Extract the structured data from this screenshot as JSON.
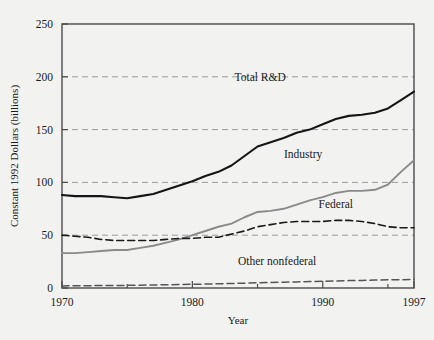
{
  "chart_data": {
    "type": "line",
    "title": "",
    "xlabel": "Year",
    "ylabel": "Constant 1992 Dollars (billions)",
    "xlim": [
      1970,
      1997
    ],
    "ylim": [
      0,
      250
    ],
    "xticks": [
      1970,
      1980,
      1990,
      1997
    ],
    "xtick_labels": [
      "1970",
      "1980",
      "1990",
      "1997"
    ],
    "minor_xticks": [
      1975,
      1985,
      1995
    ],
    "yticks": [
      0,
      50,
      100,
      150,
      200,
      250
    ],
    "ytick_labels": [
      "0",
      "50",
      "100",
      "150",
      "200",
      "250"
    ],
    "grid": "horizontal-dashed",
    "legend_position": "inline-annotations",
    "x": [
      1970,
      1971,
      1972,
      1973,
      1974,
      1975,
      1976,
      1977,
      1978,
      1979,
      1980,
      1981,
      1982,
      1983,
      1984,
      1985,
      1986,
      1987,
      1988,
      1989,
      1990,
      1991,
      1992,
      1993,
      1994,
      1995,
      1996,
      1997
    ],
    "series": [
      {
        "name": "Total R&D",
        "style": "solid",
        "color": "#151515",
        "width": 2.1,
        "label_x": 1985.2,
        "label_y": 196,
        "values": [
          88,
          87,
          87,
          87,
          86,
          85,
          87,
          89,
          93,
          97,
          101,
          106,
          110,
          116,
          125,
          134,
          138,
          142,
          147,
          150,
          155,
          160,
          163,
          164,
          166,
          170,
          178,
          186
        ]
      },
      {
        "name": "Industry",
        "style": "solid",
        "color": "#8a8a8a",
        "width": 1.9,
        "label_x": 1988.5,
        "label_y": 123,
        "values": [
          33,
          33,
          34,
          35,
          36,
          36,
          38,
          40,
          43,
          46,
          50,
          54,
          58,
          61,
          67,
          72,
          73,
          75,
          79,
          83,
          86,
          90,
          92,
          92,
          93,
          98,
          110,
          121
        ]
      },
      {
        "name": "Federal",
        "style": "dashed",
        "color": "#1a1a1a",
        "width": 1.6,
        "label_x": 1991.0,
        "label_y": 76,
        "values": [
          50,
          49,
          48,
          46,
          45,
          45,
          45,
          45,
          46,
          47,
          47,
          48,
          48,
          51,
          54,
          58,
          60,
          62,
          63,
          63,
          63,
          64,
          64,
          63,
          61,
          58,
          57,
          57
        ]
      },
      {
        "name": "Other nonfederal",
        "style": "dashed",
        "color": "#555555",
        "width": 1.5,
        "label_x": 1986.5,
        "label_y": 22,
        "values": [
          2.0,
          2.1,
          2.2,
          2.3,
          2.4,
          2.5,
          2.7,
          2.9,
          3.1,
          3.3,
          3.5,
          3.7,
          4.0,
          4.3,
          4.6,
          4.9,
          5.2,
          5.5,
          5.8,
          6.1,
          6.4,
          6.7,
          7.0,
          7.2,
          7.5,
          7.7,
          7.9,
          8.1
        ]
      }
    ]
  },
  "figure": {
    "background_color": "#f2f2f0",
    "axis_color": "#4a4a4a",
    "grid_color": "#9a9a9a"
  }
}
